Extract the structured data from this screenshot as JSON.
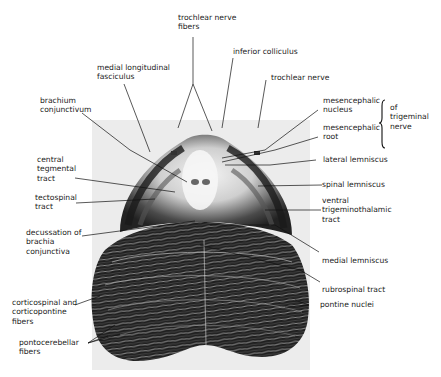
{
  "figure": {
    "colors": {
      "background": "#ffffff",
      "panel": "#ececec",
      "tissue_dark": "#1e1e1e",
      "tissue_light": "#f2f2f2",
      "label_text": "#222222",
      "leader_lines": "#111111"
    }
  },
  "labels": {
    "trochlear_nerve_fibers": "trochlear nerve\nfibers",
    "inferior_colliculus": "inferior colliculus",
    "medial_longitudinal_fasciculus": "medial longitudinal\nfasciculus",
    "trochlear_nerve": "trochlear nerve",
    "brachium_conjunctivum": "brachium\nconjunctivum",
    "mesencephalic_nucleus": "mesencephalic\nnucleus",
    "mesencephalic_root": "mesencephalic\nroot",
    "of_trigeminal_nerve": "of\ntrigeminal\nnerve",
    "central_tegmental_tract": "central\ntegmental\ntract",
    "lateral_lemniscus": "lateral lemniscus",
    "tectospinal_tract": "tectospinal\ntract",
    "spinal_lemniscus": "spinal lemniscus",
    "ventral_trigeminothalamic_tract": "ventral\ntrigeminothalamic\ntract",
    "decussation_of_brachia_conjunctiva": "decussation of\nbrachia\nconjunctiva",
    "medial_lemniscus": "medial lemniscus",
    "rubrospinal_tract": "rubrospinal tract",
    "corticospinal_and_corticopontine_fibers": "corticospinal and\ncorticopontine\nfibers",
    "pontine_nuclei": "pontine nuclei",
    "pontocerebellar_fibers": "pontocerebellar\nfibers"
  }
}
